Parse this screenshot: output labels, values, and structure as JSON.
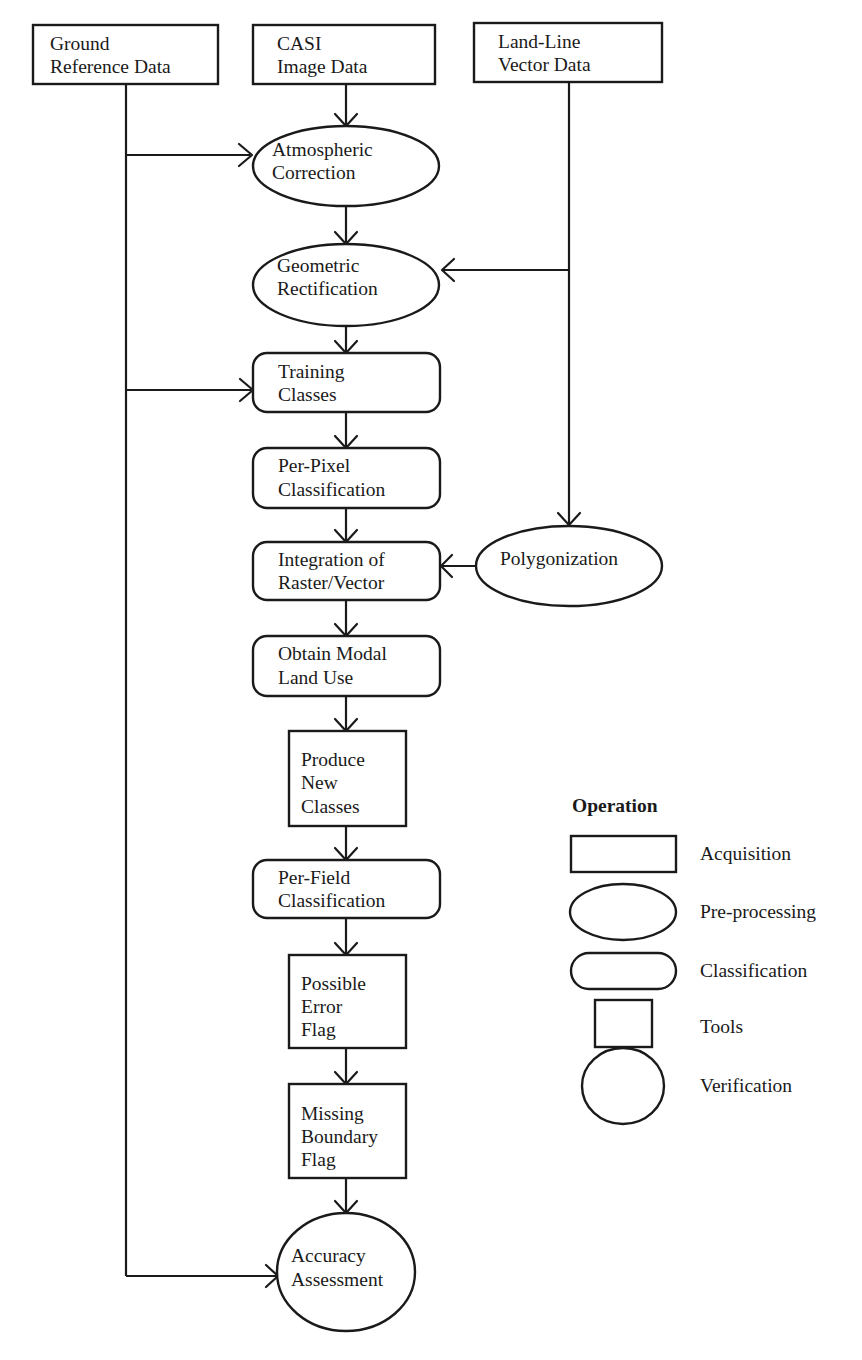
{
  "diagram": {
    "type": "flowchart",
    "nodes": {
      "ground_reference": {
        "lines": [
          "Ground",
          "Reference Data"
        ],
        "shape": "rectangle",
        "operation": "Acquisition"
      },
      "casi_image": {
        "lines": [
          "CASI",
          "Image Data"
        ],
        "shape": "rectangle",
        "operation": "Acquisition"
      },
      "land_line": {
        "lines": [
          "Land-Line",
          "Vector Data"
        ],
        "shape": "rectangle",
        "operation": "Acquisition"
      },
      "atmospheric": {
        "lines": [
          "Atmospheric",
          "Correction"
        ],
        "shape": "ellipse",
        "operation": "Pre-processing"
      },
      "geometric": {
        "lines": [
          "Geometric",
          "Rectification"
        ],
        "shape": "ellipse",
        "operation": "Pre-processing"
      },
      "training": {
        "lines": [
          "Training",
          "Classes"
        ],
        "shape": "rounded-rectangle",
        "operation": "Classification"
      },
      "per_pixel": {
        "lines": [
          "Per-Pixel",
          "Classification"
        ],
        "shape": "rounded-rectangle",
        "operation": "Classification"
      },
      "integration": {
        "lines": [
          "Integration of",
          "Raster/Vector"
        ],
        "shape": "rounded-rectangle",
        "operation": "Classification"
      },
      "polygonization": {
        "lines": [
          "Polygonization"
        ],
        "shape": "ellipse",
        "operation": "Pre-processing"
      },
      "obtain_modal": {
        "lines": [
          "Obtain Modal",
          "Land Use"
        ],
        "shape": "rounded-rectangle",
        "operation": "Classification"
      },
      "produce_new": {
        "lines": [
          "Produce",
          "New",
          "Classes"
        ],
        "shape": "square",
        "operation": "Tools"
      },
      "per_field": {
        "lines": [
          "Per-Field",
          "Classification"
        ],
        "shape": "rounded-rectangle",
        "operation": "Classification"
      },
      "possible_error": {
        "lines": [
          "Possible",
          "Error",
          "Flag"
        ],
        "shape": "square",
        "operation": "Tools"
      },
      "missing_boundary": {
        "lines": [
          "Missing",
          "Boundary",
          "Flag"
        ],
        "shape": "square",
        "operation": "Tools"
      },
      "accuracy": {
        "lines": [
          "Accuracy",
          "Assessment"
        ],
        "shape": "circle",
        "operation": "Verification"
      }
    },
    "edges": [
      [
        "CASI Image Data",
        "Atmospheric Correction"
      ],
      [
        "Ground Reference Data",
        "Atmospheric Correction"
      ],
      [
        "Atmospheric Correction",
        "Geometric Rectification"
      ],
      [
        "Land-Line Vector Data",
        "Geometric Rectification"
      ],
      [
        "Geometric Rectification",
        "Training Classes"
      ],
      [
        "Ground Reference Data",
        "Training Classes"
      ],
      [
        "Training Classes",
        "Per-Pixel Classification"
      ],
      [
        "Per-Pixel Classification",
        "Integration of Raster/Vector"
      ],
      [
        "Land-Line Vector Data",
        "Polygonization"
      ],
      [
        "Polygonization",
        "Integration of Raster/Vector"
      ],
      [
        "Integration of Raster/Vector",
        "Obtain Modal Land Use"
      ],
      [
        "Obtain Modal Land Use",
        "Produce New Classes"
      ],
      [
        "Produce New Classes",
        "Per-Field Classification"
      ],
      [
        "Per-Field Classification",
        "Possible Error Flag"
      ],
      [
        "Possible Error Flag",
        "Missing Boundary Flag"
      ],
      [
        "Missing Boundary Flag",
        "Accuracy Assessment"
      ],
      [
        "Ground Reference Data",
        "Accuracy Assessment"
      ]
    ]
  },
  "legend": {
    "title": "Operation",
    "items": [
      {
        "shape": "rectangle",
        "label": "Acquisition"
      },
      {
        "shape": "ellipse",
        "label": "Pre-processing"
      },
      {
        "shape": "rounded-rectangle",
        "label": "Classification"
      },
      {
        "shape": "square",
        "label": "Tools"
      },
      {
        "shape": "circle",
        "label": "Verification"
      }
    ]
  },
  "colors": {
    "stroke": "#1a1a1a",
    "background": "#ffffff"
  }
}
